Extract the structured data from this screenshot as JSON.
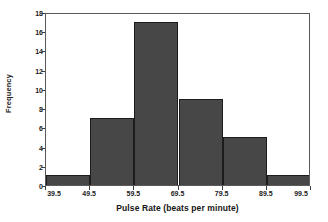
{
  "chart_data": {
    "type": "bar",
    "title": "",
    "subtitle": "",
    "xlabel": "Pulse Rate (beats per minute)",
    "ylabel": "Frequency",
    "categories": [
      "39.5-49.5",
      "49.5-59.5",
      "59.5-69.5",
      "69.5-79.5",
      "79.5-89.5",
      "89.5-99.5"
    ],
    "bin_edges": [
      39.5,
      49.5,
      59.5,
      69.5,
      79.5,
      89.5,
      99.5
    ],
    "values": [
      1,
      7,
      17,
      9,
      5,
      1
    ],
    "bin_width": 10,
    "xlim": [
      39.5,
      99.5
    ],
    "ylim": [
      0,
      18
    ],
    "x_ticks": [
      "39.5",
      "49.5",
      "59.5",
      "69.5",
      "79.5",
      "89.5",
      "99.5"
    ],
    "x_tick_values": [
      39.5,
      49.5,
      59.5,
      69.5,
      79.5,
      89.5,
      99.5
    ],
    "y_ticks": [
      "0",
      "2",
      "4",
      "6",
      "8",
      "10",
      "12",
      "14",
      "16",
      "18"
    ],
    "y_tick_values": [
      0,
      2,
      4,
      6,
      8,
      10,
      12,
      14,
      16,
      18
    ],
    "grid": false,
    "legend": false,
    "legend_position": "none",
    "total_count": 40,
    "colors": {
      "bar_fill": "#474747",
      "bar_edge": "#1c1c1c",
      "axis": "#5a5a5a",
      "text": "#1a1a1a",
      "background": "#ffffff"
    }
  }
}
